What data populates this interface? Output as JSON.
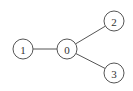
{
  "diagram": {
    "type": "graph",
    "directed": false,
    "colors": {
      "background": "#ffffff",
      "stroke": "#555555",
      "text": "#333333"
    },
    "node_radius": 10,
    "nodes": [
      {
        "id": "0",
        "label": "0",
        "x": 67,
        "y": 49
      },
      {
        "id": "1",
        "label": "1",
        "x": 23,
        "y": 49
      },
      {
        "id": "2",
        "label": "2",
        "x": 114,
        "y": 21
      },
      {
        "id": "3",
        "label": "3",
        "x": 114,
        "y": 73
      }
    ],
    "edges": [
      {
        "from": "1",
        "to": "0"
      },
      {
        "from": "0",
        "to": "2"
      },
      {
        "from": "0",
        "to": "3"
      }
    ]
  }
}
